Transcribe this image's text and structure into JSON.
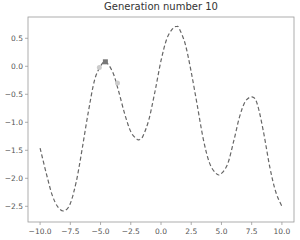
{
  "chart_data": {
    "type": "line",
    "title": "Generation number 10",
    "xlabel": "",
    "ylabel": "",
    "xlim": [
      -11.0,
      11.0
    ],
    "ylim": [
      -2.78,
      0.88
    ],
    "grid": false,
    "legend": null,
    "x_ticks": [
      -10.0,
      -7.5,
      -5.0,
      -2.5,
      0.0,
      2.5,
      5.0,
      7.5,
      10.0
    ],
    "x_tick_labels": [
      "−10.0",
      "−7.5",
      "−5.0",
      "−2.5",
      "0.0",
      "2.5",
      "5.0",
      "7.5",
      "10.0"
    ],
    "y_ticks": [
      0.5,
      0.0,
      -0.5,
      -1.0,
      -1.5,
      -2.0,
      -2.5
    ],
    "y_tick_labels": [
      "0.5",
      "0.0",
      "−0.5",
      "−1.0",
      "−1.5",
      "−2.0",
      "−2.5"
    ],
    "series": [
      {
        "name": "fitness function",
        "style": "dashed",
        "color": "#666666",
        "x": [
          -10.0,
          -9.5,
          -9.0,
          -8.5,
          -8.0,
          -7.5,
          -7.0,
          -6.5,
          -6.0,
          -5.5,
          -5.0,
          -4.6,
          -4.0,
          -3.5,
          -3.0,
          -2.5,
          -2.0,
          -1.8,
          -1.5,
          -1.0,
          -0.5,
          0.0,
          0.5,
          1.0,
          1.3,
          1.5,
          2.0,
          2.5,
          3.0,
          3.5,
          4.0,
          4.5,
          4.9,
          5.5,
          6.0,
          6.5,
          7.0,
          7.6,
          8.0,
          8.5,
          9.0,
          9.5,
          10.0
        ],
        "y": [
          -1.46,
          -1.9,
          -2.3,
          -2.52,
          -2.58,
          -2.45,
          -2.05,
          -1.45,
          -0.8,
          -0.25,
          0.0,
          0.08,
          -0.1,
          -0.45,
          -0.85,
          -1.17,
          -1.3,
          -1.31,
          -1.25,
          -0.95,
          -0.45,
          0.1,
          0.5,
          0.68,
          0.71,
          0.68,
          0.4,
          -0.1,
          -0.7,
          -1.3,
          -1.72,
          -1.9,
          -1.93,
          -1.75,
          -1.35,
          -0.9,
          -0.62,
          -0.55,
          -0.7,
          -1.2,
          -1.8,
          -2.25,
          -2.5
        ]
      },
      {
        "name": "best individual",
        "type": "scatter",
        "color": "#777777",
        "x": [
          -4.6
        ],
        "y": [
          0.08
        ]
      },
      {
        "name": "population",
        "type": "scatter",
        "color": "#cccccc",
        "x": [
          -5.1,
          -3.6
        ],
        "y": [
          -0.02,
          -0.3
        ]
      }
    ]
  }
}
